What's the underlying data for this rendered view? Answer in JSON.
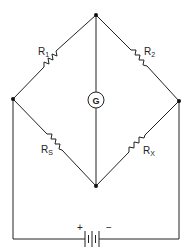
{
  "diagram": {
    "type": "Wheatstone bridge circuit",
    "nodes": {
      "top": {
        "x": 96,
        "y": 15
      },
      "left": {
        "x": 13,
        "y": 99
      },
      "right": {
        "x": 179,
        "y": 101
      },
      "bottom": {
        "x": 96,
        "y": 186
      }
    },
    "resistors": [
      {
        "id": "r1",
        "label": "R",
        "subscript": "1",
        "from": "left",
        "to": "top"
      },
      {
        "id": "r2",
        "label": "R",
        "subscript": "2",
        "from": "top",
        "to": "right"
      },
      {
        "id": "rs",
        "label": "R",
        "subscript": "S",
        "from": "left",
        "to": "bottom"
      },
      {
        "id": "rx",
        "label": "R",
        "subscript": "X",
        "from": "bottom",
        "to": "right"
      }
    ],
    "galvanometer": {
      "label": "G",
      "from": "top",
      "to": "bottom"
    },
    "battery": {
      "plus_label": "+",
      "minus_label": "−"
    },
    "colors": {
      "line": "#222222",
      "background": "#ffffff"
    }
  }
}
